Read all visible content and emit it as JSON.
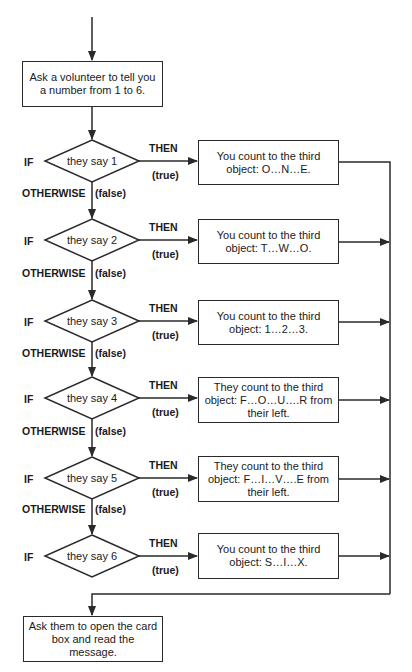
{
  "diagram": {
    "type": "flowchart",
    "start_box": "Ask a volunteer to tell you a number from 1 to 6.",
    "end_box": "Ask them to open the card box and read the message.",
    "labels": {
      "if": "IF",
      "then": "THEN",
      "true": "(true)",
      "otherwise": "OTHERWISE",
      "false": "(false)"
    },
    "decisions": [
      {
        "condition": "they say 1",
        "action": "You count to the third object: O…N…E."
      },
      {
        "condition": "they say 2",
        "action": "You count to the third object: T…W…O."
      },
      {
        "condition": "they say 3",
        "action": "You count to the third object: 1…2…3."
      },
      {
        "condition": "they say 4",
        "action": "They count to the third object: F…O…U….R from their left."
      },
      {
        "condition": "they say 5",
        "action": "They count to the third object: F…I…V….E from their left."
      },
      {
        "condition": "they say 6",
        "action": "You count to the third object: S…I…X."
      }
    ],
    "colors": {
      "stroke": "#2a2a2a",
      "background": "#ffffff",
      "text": "#1a1a1a"
    }
  }
}
